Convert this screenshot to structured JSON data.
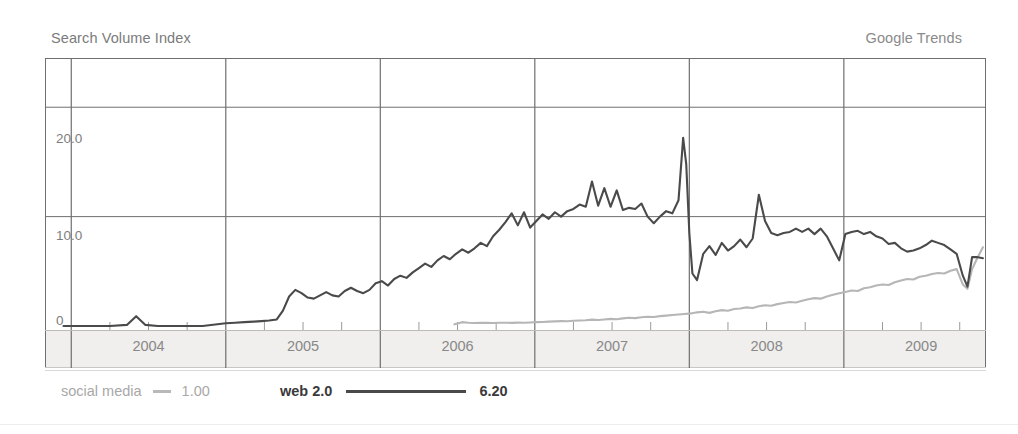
{
  "header": {
    "y_axis_title": "Search Volume Index",
    "source_label": "Google Trends"
  },
  "legend": {
    "items": [
      {
        "name": "social media",
        "value": "1.00",
        "color": "#b9b9b9",
        "style": "light"
      },
      {
        "name": "web 2.0",
        "value": "6.20",
        "color": "#4a4a4a",
        "style": "bold"
      }
    ]
  },
  "chart_data": {
    "type": "line",
    "title": "Search Volume Index",
    "subtitle": "Google Trends",
    "xlabel": "",
    "ylabel": "Search Volume Index",
    "ylim": [
      0,
      24.5
    ],
    "xlim": [
      2003.83,
      2009.92
    ],
    "grid": true,
    "y_ticks": [
      0,
      10,
      20
    ],
    "y_tick_labels": [
      "0",
      "10.0",
      "20.0"
    ],
    "x_ticks": [
      2004,
      2005,
      2006,
      2007,
      2008,
      2009
    ],
    "x_tick_labels": [
      "2004",
      "2005",
      "2006",
      "2007",
      "2008",
      "2009"
    ],
    "x_minor_ticks_per_year": 4,
    "legend_position": "bottom",
    "series": [
      {
        "name": "web 2.0",
        "color": "#4a4a4a",
        "width": 2.1,
        "current_value": 6.2,
        "x": [
          2003.95,
          2004.1,
          2004.25,
          2004.36,
          2004.42,
          2004.48,
          2004.56,
          2004.7,
          2004.85,
          2005.0,
          2005.06,
          2005.12,
          2005.18,
          2005.23,
          2005.28,
          2005.33,
          2005.37,
          2005.41,
          2005.45,
          2005.49,
          2005.53,
          2005.57,
          2005.61,
          2005.65,
          2005.69,
          2005.73,
          2005.77,
          2005.81,
          2005.85,
          2005.89,
          2005.93,
          2005.97,
          2006.01,
          2006.05,
          2006.09,
          2006.13,
          2006.17,
          2006.21,
          2006.25,
          2006.29,
          2006.33,
          2006.37,
          2006.41,
          2006.45,
          2006.49,
          2006.53,
          2006.57,
          2006.61,
          2006.65,
          2006.69,
          2006.73,
          2006.77,
          2006.81,
          2006.85,
          2006.89,
          2006.93,
          2006.97,
          2007.01,
          2007.05,
          2007.09,
          2007.13,
          2007.17,
          2007.21,
          2007.25,
          2007.29,
          2007.33,
          2007.37,
          2007.41,
          2007.45,
          2007.49,
          2007.53,
          2007.57,
          2007.61,
          2007.65,
          2007.69,
          2007.73,
          2007.77,
          2007.81,
          2007.85,
          2007.89,
          2007.93,
          2007.96,
          2007.98,
          2008.0,
          2008.02,
          2008.05,
          2008.09,
          2008.13,
          2008.17,
          2008.21,
          2008.25,
          2008.29,
          2008.33,
          2008.37,
          2008.41,
          2008.45,
          2008.49,
          2008.53,
          2008.57,
          2008.61,
          2008.65,
          2008.69,
          2008.73,
          2008.77,
          2008.81,
          2008.85,
          2008.89,
          2008.93,
          2008.97,
          2009.01,
          2009.05,
          2009.09,
          2009.13,
          2009.17,
          2009.21,
          2009.25,
          2009.29,
          2009.33,
          2009.37,
          2009.41,
          2009.45,
          2009.49,
          2009.53,
          2009.57,
          2009.61,
          2009.65,
          2009.69,
          2009.73,
          2009.77,
          2009.8,
          2009.83,
          2009.86,
          2009.9
        ],
        "y": [
          0.0,
          0.0,
          0.0,
          0.1,
          0.9,
          0.1,
          0.0,
          0.0,
          0.0,
          0.25,
          0.3,
          0.35,
          0.4,
          0.45,
          0.5,
          0.6,
          1.4,
          2.7,
          3.3,
          3.0,
          2.6,
          2.5,
          2.8,
          3.1,
          2.8,
          2.7,
          3.2,
          3.5,
          3.2,
          3.0,
          3.3,
          3.9,
          4.1,
          3.7,
          4.3,
          4.6,
          4.4,
          4.9,
          5.3,
          5.7,
          5.4,
          6.0,
          6.4,
          6.1,
          6.6,
          7.0,
          6.7,
          7.1,
          7.6,
          7.3,
          8.2,
          8.8,
          9.5,
          10.3,
          9.2,
          10.4,
          9.0,
          9.6,
          10.2,
          9.8,
          10.4,
          10.0,
          10.5,
          10.7,
          11.1,
          10.9,
          13.2,
          11.0,
          12.6,
          10.9,
          12.4,
          10.6,
          10.8,
          10.7,
          11.2,
          10.0,
          9.4,
          10.0,
          10.5,
          10.3,
          11.5,
          17.2,
          14.8,
          8.5,
          4.8,
          4.2,
          6.6,
          7.3,
          6.5,
          7.6,
          6.9,
          7.3,
          7.9,
          7.2,
          8.0,
          12.0,
          9.6,
          8.5,
          8.3,
          8.5,
          8.6,
          8.9,
          8.6,
          8.9,
          8.4,
          8.9,
          8.2,
          7.1,
          6.0,
          8.4,
          8.6,
          8.7,
          8.4,
          8.6,
          8.2,
          8.0,
          7.5,
          7.6,
          7.1,
          6.8,
          6.9,
          7.1,
          7.4,
          7.8,
          7.6,
          7.4,
          7.0,
          6.6,
          4.6,
          3.6,
          6.3,
          6.3,
          6.2
        ]
      },
      {
        "name": "social media",
        "color": "#b6b6b6",
        "width": 2.1,
        "current_value": 1.0,
        "x": [
          2006.48,
          2006.53,
          2006.57,
          2006.61,
          2006.65,
          2006.69,
          2006.73,
          2006.77,
          2006.81,
          2006.85,
          2006.89,
          2006.93,
          2006.97,
          2007.01,
          2007.05,
          2007.09,
          2007.13,
          2007.17,
          2007.21,
          2007.25,
          2007.29,
          2007.33,
          2007.37,
          2007.41,
          2007.45,
          2007.49,
          2007.53,
          2007.57,
          2007.61,
          2007.65,
          2007.69,
          2007.73,
          2007.77,
          2007.81,
          2007.85,
          2007.89,
          2007.93,
          2007.97,
          2008.01,
          2008.05,
          2008.09,
          2008.13,
          2008.17,
          2008.21,
          2008.25,
          2008.29,
          2008.33,
          2008.37,
          2008.41,
          2008.45,
          2008.49,
          2008.53,
          2008.57,
          2008.61,
          2008.65,
          2008.69,
          2008.73,
          2008.77,
          2008.81,
          2008.85,
          2008.89,
          2008.93,
          2008.97,
          2009.01,
          2009.05,
          2009.09,
          2009.13,
          2009.17,
          2009.21,
          2009.25,
          2009.29,
          2009.33,
          2009.37,
          2009.41,
          2009.45,
          2009.49,
          2009.53,
          2009.57,
          2009.61,
          2009.65,
          2009.69,
          2009.73,
          2009.77,
          2009.8,
          2009.83,
          2009.86,
          2009.9
        ],
        "y": [
          0.15,
          0.35,
          0.3,
          0.28,
          0.3,
          0.29,
          0.28,
          0.3,
          0.3,
          0.29,
          0.31,
          0.3,
          0.32,
          0.35,
          0.36,
          0.4,
          0.42,
          0.45,
          0.44,
          0.48,
          0.5,
          0.52,
          0.58,
          0.55,
          0.6,
          0.65,
          0.62,
          0.7,
          0.75,
          0.72,
          0.8,
          0.85,
          0.82,
          0.9,
          0.95,
          1.0,
          1.05,
          1.1,
          1.15,
          1.25,
          1.3,
          1.2,
          1.35,
          1.45,
          1.4,
          1.55,
          1.6,
          1.7,
          1.65,
          1.8,
          1.9,
          1.85,
          2.0,
          2.1,
          2.2,
          2.15,
          2.3,
          2.45,
          2.55,
          2.5,
          2.7,
          2.85,
          3.0,
          3.1,
          3.25,
          3.2,
          3.45,
          3.55,
          3.7,
          3.8,
          3.75,
          4.0,
          4.15,
          4.3,
          4.25,
          4.5,
          4.6,
          4.75,
          4.85,
          4.8,
          5.05,
          5.2,
          3.8,
          3.4,
          5.2,
          6.1,
          7.2
        ]
      }
    ]
  }
}
